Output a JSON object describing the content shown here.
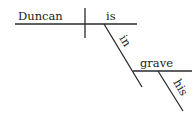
{
  "diagram": {
    "type": "sentence-diagram",
    "sentence": "Duncan is in his grave",
    "words": {
      "subject": "Duncan",
      "verb": "is",
      "preposition": "in",
      "prep_object": "grave",
      "modifier": "his"
    },
    "colors": {
      "line": "#2a2a2a",
      "text": "#222222",
      "background": "#ffffff"
    }
  }
}
